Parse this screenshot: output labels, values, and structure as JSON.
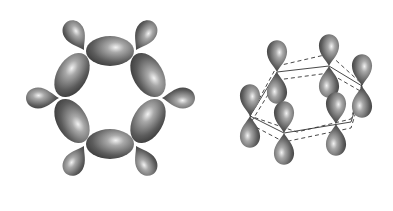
{
  "diagram": {
    "left_panel": {
      "name": "sp2 sigma framework (top view)",
      "lobe_color": "#5a5a5a"
    },
    "right_panel": {
      "name": "p orbitals perpendicular to ring (perspective view)",
      "lobe_color": "#5a5a5a"
    },
    "background": "#ffffff"
  }
}
